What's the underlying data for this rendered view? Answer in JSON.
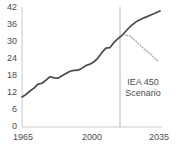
{
  "chart_data": {
    "type": "line",
    "title": "",
    "subtitle": "",
    "xlabel": "",
    "ylabel": "",
    "xlim": [
      1965,
      2035
    ],
    "ylim": [
      0,
      42
    ],
    "grid": false,
    "legend_position": "none",
    "y_ticks": [
      "42",
      "36",
      "30",
      "24",
      "18",
      "12",
      "6",
      "0"
    ],
    "y_tick_values": [
      42,
      36,
      30,
      24,
      18,
      12,
      6,
      0
    ],
    "x_ticks": [
      "1965",
      "2000",
      "2035"
    ],
    "x_tick_values": [
      1965,
      2000,
      2035
    ],
    "annotations": [
      {
        "name": "iea-450-scenario-label",
        "line1": "IEA 450",
        "line2": "Scenario",
        "x": 2019,
        "y": 14
      }
    ],
    "divider": {
      "name": "present-year-divider",
      "x": 2014,
      "style": "solid",
      "color": "#b5b5b5"
    },
    "series": [
      {
        "name": "Historical and projected",
        "style": "solid",
        "color": "#4a4a4a",
        "points": [
          [
            1965,
            10.5
          ],
          [
            1967,
            11.4
          ],
          [
            1969,
            12.6
          ],
          [
            1971,
            13.6
          ],
          [
            1973,
            15.0
          ],
          [
            1975,
            15.3
          ],
          [
            1977,
            16.4
          ],
          [
            1979,
            17.6
          ],
          [
            1981,
            17.2
          ],
          [
            1983,
            17.1
          ],
          [
            1985,
            17.9
          ],
          [
            1987,
            18.7
          ],
          [
            1989,
            19.5
          ],
          [
            1991,
            19.8
          ],
          [
            1993,
            19.9
          ],
          [
            1995,
            20.6
          ],
          [
            1997,
            21.5
          ],
          [
            1999,
            22.0
          ],
          [
            2001,
            22.8
          ],
          [
            2003,
            24.2
          ],
          [
            2005,
            26.1
          ],
          [
            2007,
            27.6
          ],
          [
            2009,
            27.8
          ],
          [
            2011,
            29.6
          ],
          [
            2013,
            30.9
          ],
          [
            2015,
            32.1
          ],
          [
            2017,
            33.6
          ],
          [
            2019,
            35.1
          ],
          [
            2022,
            36.8
          ],
          [
            2026,
            38.2
          ],
          [
            2030,
            39.4
          ],
          [
            2034,
            40.6
          ]
        ]
      },
      {
        "name": "IEA 450 Scenario",
        "style": "dotted",
        "color": "#9a9a9a",
        "points": [
          [
            2016,
            32.3
          ],
          [
            2019,
            31.8
          ],
          [
            2022,
            30.0
          ],
          [
            2026,
            27.4
          ],
          [
            2030,
            25.0
          ],
          [
            2033,
            23.0
          ]
        ]
      }
    ]
  }
}
